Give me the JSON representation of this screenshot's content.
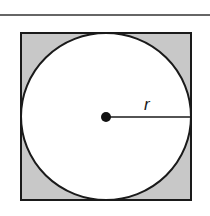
{
  "diagram": {
    "radius_label": "r",
    "colors": {
      "shading": "#c8c8c8",
      "stroke": "#1a1a1a",
      "circle_fill": "#ffffff",
      "background": "#ffffff"
    }
  }
}
